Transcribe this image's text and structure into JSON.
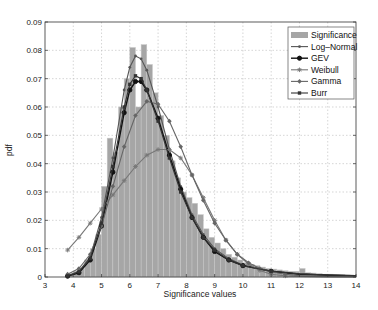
{
  "chart_data": {
    "type": "bar",
    "title": "",
    "xlabel": "Significance values",
    "ylabel": "pdf",
    "xlim": [
      3,
      14
    ],
    "ylim": [
      0,
      0.09
    ],
    "grid": true,
    "legend_position": "upper right",
    "xticks": [
      "3",
      "4",
      "5",
      "6",
      "7",
      "8",
      "9",
      "10",
      "11",
      "12",
      "13",
      "14"
    ],
    "yticks": [
      "0",
      "0.01",
      "0.02",
      "0.03",
      "0.04",
      "0.05",
      "0.06",
      "0.07",
      "0.08",
      "0.09"
    ],
    "legend": [
      "Significance",
      "Log–Normal",
      "GEV",
      "Weibull",
      "Gamma",
      "Burr"
    ],
    "histogram": {
      "name": "Significance",
      "bin_width": 0.2,
      "bin_starts": [
        3.8,
        4.0,
        4.2,
        4.4,
        4.6,
        4.8,
        5.0,
        5.2,
        5.4,
        5.6,
        5.8,
        6.0,
        6.2,
        6.4,
        6.6,
        6.8,
        7.0,
        7.2,
        7.4,
        7.6,
        7.8,
        8.0,
        8.2,
        8.4,
        8.6,
        8.8,
        9.0,
        9.2,
        9.4,
        9.6,
        9.8,
        10.0,
        10.2,
        10.4,
        10.6,
        10.8,
        11.0,
        11.2,
        11.4,
        11.6,
        11.8,
        12.0,
        12.2,
        12.4,
        12.6,
        12.8,
        13.0,
        13.2,
        13.4,
        13.6,
        13.8
      ],
      "values": [
        0.001,
        0.002,
        0.003,
        0.006,
        0.01,
        0.015,
        0.032,
        0.049,
        0.044,
        0.06,
        0.07,
        0.081,
        0.06,
        0.082,
        0.075,
        0.065,
        0.057,
        0.05,
        0.041,
        0.035,
        0.03,
        0.028,
        0.026,
        0.022,
        0.017,
        0.014,
        0.012,
        0.01,
        0.008,
        0.007,
        0.006,
        0.005,
        0.0045,
        0.004,
        0.0035,
        0.003,
        0.0028,
        0.0025,
        0.0022,
        0.002,
        0.002,
        0.003,
        0.0015,
        0.0014,
        0.0012,
        0.001,
        0.001,
        0.0009,
        0.0008,
        0.0007,
        0.0006
      ]
    },
    "series": [
      {
        "name": "Log–Normal",
        "color": "#555555",
        "marker": "dot",
        "x": [
          3.8,
          4.2,
          4.6,
          5.0,
          5.4,
          5.8,
          6.0,
          6.2,
          6.4,
          6.6,
          7.0,
          7.4,
          7.8,
          8.2,
          8.6,
          9.0,
          9.5,
          10,
          11,
          12,
          13,
          14
        ],
        "y": [
          0.0005,
          0.002,
          0.007,
          0.021,
          0.042,
          0.066,
          0.074,
          0.078,
          0.077,
          0.073,
          0.06,
          0.045,
          0.032,
          0.022,
          0.015,
          0.01,
          0.0065,
          0.0042,
          0.002,
          0.0011,
          0.0007,
          0.0005
        ]
      },
      {
        "name": "GEV",
        "color": "#111111",
        "marker": "circle",
        "x": [
          3.8,
          4.2,
          4.6,
          5.0,
          5.4,
          5.8,
          6.0,
          6.2,
          6.4,
          6.6,
          7.0,
          7.4,
          7.8,
          8.2,
          8.6,
          9.0,
          9.5,
          10,
          11,
          12,
          13,
          14
        ],
        "y": [
          0.0003,
          0.0015,
          0.006,
          0.018,
          0.037,
          0.058,
          0.066,
          0.069,
          0.069,
          0.066,
          0.056,
          0.043,
          0.031,
          0.021,
          0.014,
          0.009,
          0.006,
          0.004,
          0.002,
          0.001,
          0.0006,
          0.0004
        ]
      },
      {
        "name": "Weibull",
        "color": "#777777",
        "marker": "star",
        "x": [
          3.8,
          4.2,
          4.6,
          5.0,
          5.4,
          5.8,
          6.2,
          6.6,
          7.0,
          7.4,
          7.8,
          8.2,
          8.6,
          9.0,
          9.4,
          9.8,
          10.2,
          10.6,
          11,
          11.5,
          12,
          13,
          14
        ],
        "y": [
          0.0095,
          0.014,
          0.019,
          0.024,
          0.029,
          0.034,
          0.039,
          0.043,
          0.045,
          0.045,
          0.042,
          0.036,
          0.028,
          0.02,
          0.013,
          0.008,
          0.0045,
          0.0023,
          0.001,
          0.0004,
          0.0002,
          0,
          0
        ]
      },
      {
        "name": "Gamma",
        "color": "#666666",
        "marker": "diamond",
        "x": [
          3.8,
          4.2,
          4.6,
          5.0,
          5.4,
          5.8,
          6.2,
          6.6,
          7.0,
          7.4,
          7.8,
          8.2,
          8.6,
          9.0,
          9.4,
          9.8,
          10.2,
          10.6,
          11,
          11.5,
          12,
          13,
          14
        ],
        "y": [
          0.001,
          0.003,
          0.008,
          0.018,
          0.032,
          0.046,
          0.057,
          0.062,
          0.061,
          0.055,
          0.046,
          0.036,
          0.027,
          0.019,
          0.013,
          0.008,
          0.005,
          0.003,
          0.0018,
          0.001,
          0.0005,
          0.0002,
          0.0001
        ]
      },
      {
        "name": "Burr",
        "color": "#333333",
        "marker": "square",
        "x": [
          3.8,
          4.2,
          4.6,
          5.0,
          5.4,
          5.8,
          6.0,
          6.2,
          6.4,
          6.6,
          7.0,
          7.4,
          7.8,
          8.2,
          8.6,
          9.0,
          9.5,
          10,
          11,
          12,
          13,
          14
        ],
        "y": [
          0.0004,
          0.0018,
          0.0065,
          0.019,
          0.039,
          0.06,
          0.068,
          0.071,
          0.07,
          0.066,
          0.055,
          0.042,
          0.03,
          0.021,
          0.014,
          0.0095,
          0.006,
          0.004,
          0.002,
          0.0011,
          0.0007,
          0.0005
        ]
      }
    ]
  }
}
